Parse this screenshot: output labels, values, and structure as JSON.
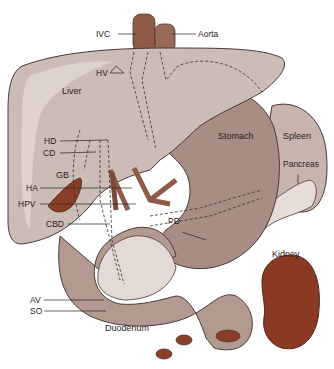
{
  "diagram": {
    "colors": {
      "liver": "#cbbcb5",
      "liver_highlight": "#ddd2cc",
      "stomach": "#a88d84",
      "stomach_light": "#bca49b",
      "spleen": "#c7b5ad",
      "pancreas": "#e6ddd8",
      "kidney": "#8a3a22",
      "vessel": "#8f5a48",
      "gallbladder": "#8a3e28",
      "duodenum": "#b39a91",
      "outline": "#4a3a34",
      "label_line": "#2a2220"
    },
    "labels": {
      "ivc": "IVC",
      "aorta": "Aorta",
      "hv": "HV",
      "liver": "Liver",
      "hd": "HD",
      "cd": "CD",
      "gb": "GB",
      "ha": "HA",
      "hpv": "HPV",
      "cbd": "CBD",
      "pd": "PD",
      "stomach": "Stomach",
      "spleen": "Spleen",
      "pancreas": "Pancreas",
      "kidney": "Kidney",
      "av": "AV",
      "so": "SO",
      "duodenum": "Duodenum"
    }
  }
}
